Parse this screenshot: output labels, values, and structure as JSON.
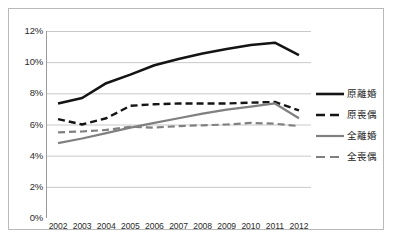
{
  "chart_data": {
    "type": "line",
    "title": "",
    "subtitle": "",
    "xlabel": "",
    "ylabel": "",
    "categories": [
      "2002",
      "2003",
      "2004",
      "2005",
      "2006",
      "2007",
      "2008",
      "2009",
      "2010",
      "2011",
      "2012"
    ],
    "ylim": [
      0,
      12
    ],
    "y_ticks": [
      "0%",
      "2%",
      "4%",
      "6%",
      "8%",
      "10%",
      "12%"
    ],
    "y_tick_values": [
      0,
      2,
      4,
      6,
      8,
      10,
      12
    ],
    "y_unit": "%",
    "grid": "horizontal",
    "legend_position": "right",
    "series": [
      {
        "name": "原離婚",
        "style": "solid",
        "color": "#141414",
        "width": 2.6,
        "values": [
          7.35,
          7.7,
          8.65,
          9.2,
          9.8,
          10.2,
          10.55,
          10.85,
          11.1,
          11.25,
          10.45
        ]
      },
      {
        "name": "原喪偶",
        "style": "dashed",
        "color": "#141414",
        "width": 2.4,
        "values": [
          6.35,
          6.0,
          6.4,
          7.2,
          7.3,
          7.35,
          7.35,
          7.35,
          7.4,
          7.45,
          6.9
        ]
      },
      {
        "name": "全離婚",
        "style": "solid",
        "color": "#808080",
        "width": 2.2,
        "values": [
          4.8,
          5.1,
          5.45,
          5.8,
          6.1,
          6.4,
          6.7,
          6.95,
          7.15,
          7.35,
          6.4
        ]
      },
      {
        "name": "全喪偶",
        "style": "dashed",
        "color": "#808080",
        "width": 2.2,
        "values": [
          5.5,
          5.55,
          5.65,
          5.85,
          5.8,
          5.9,
          5.95,
          6.0,
          6.1,
          6.05,
          5.9
        ]
      }
    ]
  },
  "axes": {
    "y_tick_labels": [
      "12%",
      "10%",
      "8%",
      "6%",
      "4%",
      "2%",
      "0%"
    ],
    "x_tick_labels": [
      "2002",
      "2003",
      "2004",
      "2005",
      "2006",
      "2007",
      "2008",
      "2009",
      "2010",
      "2011",
      "2012"
    ]
  },
  "legend": {
    "items": [
      {
        "label": "原離婚"
      },
      {
        "label": "原喪偶"
      },
      {
        "label": "全離婚"
      },
      {
        "label": "全喪偶"
      }
    ]
  },
  "colors": {
    "series_dark": "#141414",
    "series_gray": "#808080",
    "gridline": "#c8c8c8",
    "axis": "#9a9a9a",
    "border": "#b9b9b9",
    "text": "#2b2b2b"
  },
  "caption": {
    "text": ""
  }
}
